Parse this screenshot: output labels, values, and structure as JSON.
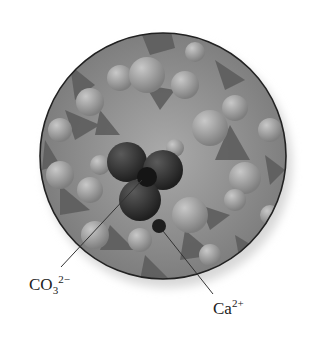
{
  "figure": {
    "type": "space-filling molecular model, calcium carbonate crystal surface (magnified view)",
    "labels": [
      {
        "id": "carbonate",
        "base": "CO",
        "subscript": "3",
        "superscript": "2−"
      },
      {
        "id": "calcium",
        "base": "Ca",
        "subscript": "",
        "superscript": "2+"
      }
    ]
  },
  "colors": {
    "background": "#ffffff",
    "circle_outline": "#222222",
    "surface_base": "#8c8c8c",
    "highlighted_ion": "#3a3a3a",
    "leader_line": "#333333"
  }
}
